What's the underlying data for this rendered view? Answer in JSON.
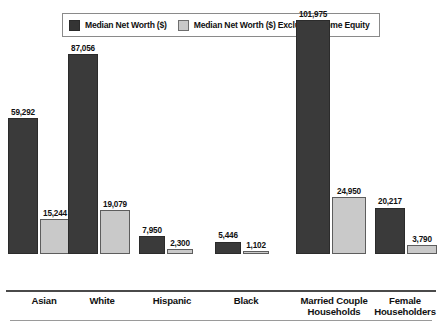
{
  "legend": {
    "items": [
      {
        "label": "Median Net Worth ($)",
        "swatch": "dark",
        "color": "#3a3a3a"
      },
      {
        "label": "Median Net Worth ($) Excluding Home Equity",
        "swatch": "light",
        "color": "#c9c9c9"
      }
    ]
  },
  "chart_data": {
    "type": "bar",
    "title": "",
    "xlabel": "",
    "ylabel": "",
    "grid": false,
    "legend_position": "top",
    "ylim": [
      0,
      101975
    ],
    "categories": [
      "Asian",
      "White",
      "Hispanic",
      "Black",
      "Married Couple Households",
      "Female Householders"
    ],
    "category_lines": [
      [
        "Asian"
      ],
      [
        "White"
      ],
      [
        "Hispanic"
      ],
      [
        "Black"
      ],
      [
        "Married Couple",
        "Households"
      ],
      [
        "Female",
        "Householders"
      ]
    ],
    "series": [
      {
        "name": "Median Net Worth ($)",
        "color": "#3a3a3a",
        "values": [
          59292,
          87056,
          7950,
          5446,
          101975,
          20217
        ],
        "labels": [
          "59,292",
          "87,056",
          "7,950",
          "5,446",
          "101,975",
          "20,217"
        ]
      },
      {
        "name": "Median Net Worth ($) Excluding Home Equity",
        "color": "#c9c9c9",
        "values": [
          15244,
          19079,
          2300,
          1102,
          24950,
          3790
        ],
        "labels": [
          "15,244",
          "19,079",
          "2,300",
          "1,102",
          "24,950",
          "3,790"
        ]
      }
    ]
  }
}
